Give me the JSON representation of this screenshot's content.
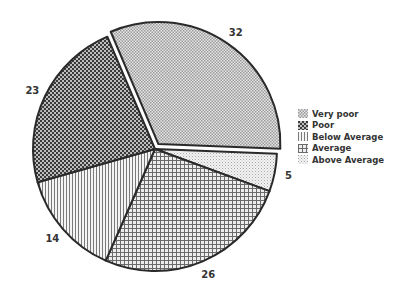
{
  "chart_data": {
    "type": "pie",
    "title": "",
    "categories": [
      "Very poor",
      "Poor",
      "Below Average",
      "Average",
      "Above Average"
    ],
    "values": [
      32,
      23,
      14,
      26,
      5
    ],
    "unit": "%",
    "draw_order_clockwise": [
      "Very poor",
      "Above Average",
      "Average",
      "Below Average",
      "Poor"
    ],
    "start_angle_deg": -113,
    "exploded": [
      "Very poor"
    ],
    "legend_position": "right",
    "fill_style": "monochrome hatch patterns",
    "patterns": {
      "Very poor": "fine checker (light)",
      "Poor": "dense checker (dark)",
      "Below Average": "vertical lines",
      "Average": "grid / cross-hatch",
      "Above Average": "fine dots (light)"
    },
    "data_labels": {
      "Very poor": "32",
      "Poor": "23",
      "Below Average": "14",
      "Average": "26",
      "Above Average": "5"
    }
  },
  "legend": {
    "items": [
      {
        "label": "Very poor",
        "pattern": "p-verypoor"
      },
      {
        "label": "Poor",
        "pattern": "p-poor"
      },
      {
        "label": "Below Average",
        "pattern": "p-below"
      },
      {
        "label": "Average",
        "pattern": "p-average"
      },
      {
        "label": "Above Average",
        "pattern": "p-above"
      }
    ]
  },
  "colors": {
    "outline": "#2a2a2a",
    "label": "#333333",
    "background": "#ffffff"
  }
}
